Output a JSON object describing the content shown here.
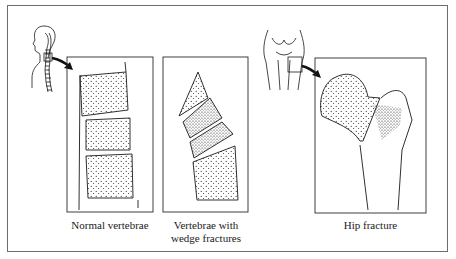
{
  "figure": {
    "panels": [
      {
        "id": "normal",
        "caption": "Normal vertebrae",
        "locator": "human head and spine silhouette with box on thoracic spine"
      },
      {
        "id": "wedge",
        "caption_line1": "Vertebrae with",
        "caption_line2": "wedge fractures"
      },
      {
        "id": "hip",
        "caption": "Hip fracture",
        "locator": "pelvis and femur outline with box on right hip"
      }
    ],
    "colors": {
      "line": "#1a1a1a",
      "frame": "#6d6d6d",
      "background": "#ffffff"
    }
  }
}
